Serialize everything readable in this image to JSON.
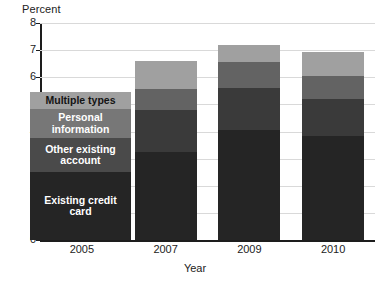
{
  "chart_data": {
    "type": "bar",
    "stacked": true,
    "title": "",
    "xlabel": "Year",
    "ylabel": "Percent",
    "categories": [
      "2005",
      "2007",
      "2009",
      "2010"
    ],
    "ylim": [
      0,
      8
    ],
    "yticks": [
      "0",
      "1",
      "2",
      "3",
      "4",
      "5",
      "6",
      "7",
      "8"
    ],
    "grid": true,
    "legend_position": "overlay-left",
    "series": [
      {
        "name": "Existing credit card",
        "color": "#252525",
        "values": [
          null,
          3.25,
          4.05,
          3.85
        ]
      },
      {
        "name": "Other existing account",
        "color": "#3a3a3a",
        "values": [
          null,
          1.55,
          1.55,
          1.35
        ]
      },
      {
        "name": "Personal information",
        "color": "#636363",
        "values": [
          null,
          0.75,
          0.95,
          0.85
        ]
      },
      {
        "name": "Multiple types",
        "color": "#a0a0a0",
        "values": [
          null,
          1.05,
          0.65,
          0.9
        ]
      }
    ],
    "totals": [
      null,
      6.6,
      7.2,
      6.95
    ]
  },
  "axes": {
    "y_title": "Percent",
    "x_title": "Year"
  },
  "legend": {
    "entries": [
      {
        "label": "Multiple types",
        "color": "#a0a0a0",
        "text_color": "#141414"
      },
      {
        "label": "Personal information",
        "color": "#777777",
        "text_color": "#ffffff"
      },
      {
        "label": "Other existing account",
        "color": "#4a4a4a",
        "text_color": "#ffffff"
      },
      {
        "label": "Existing credit card",
        "color": "#252525",
        "text_color": "#ffffff"
      }
    ]
  }
}
